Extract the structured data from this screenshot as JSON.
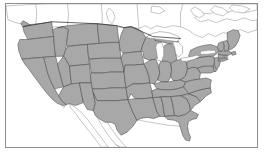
{
  "figure": {
    "kind": "map-figure",
    "frame": {
      "visible": true,
      "border_color": "#8c8c8c"
    },
    "background_color": "#ffffff"
  },
  "map": {
    "name": "united-states-map",
    "projection_hint": "albers-usa-like",
    "land_fill": "#a8a8a8",
    "state_border_color": "#4a4a4a",
    "neighbor_fill": "#ffffff",
    "neighbor_border_color": "#8a8a8a",
    "water_fill": "#ffffff",
    "labels_visible": false,
    "legend_visible": false,
    "features": {
      "states_filled": true,
      "great_lakes_unfilled": true,
      "canada_outline": true,
      "mexico_outline": true,
      "baja_california_outline": true
    },
    "regions": [
      {
        "id": "WA",
        "name": "Washington",
        "filled": true
      },
      {
        "id": "OR",
        "name": "Oregon",
        "filled": true
      },
      {
        "id": "CA",
        "name": "California",
        "filled": true
      },
      {
        "id": "NV",
        "name": "Nevada",
        "filled": true
      },
      {
        "id": "ID",
        "name": "Idaho",
        "filled": true
      },
      {
        "id": "MT",
        "name": "Montana",
        "filled": true
      },
      {
        "id": "WY",
        "name": "Wyoming",
        "filled": true
      },
      {
        "id": "UT",
        "name": "Utah",
        "filled": true
      },
      {
        "id": "AZ",
        "name": "Arizona",
        "filled": true
      },
      {
        "id": "CO",
        "name": "Colorado",
        "filled": true
      },
      {
        "id": "NM",
        "name": "New Mexico",
        "filled": true
      },
      {
        "id": "ND",
        "name": "North Dakota",
        "filled": true
      },
      {
        "id": "SD",
        "name": "South Dakota",
        "filled": true
      },
      {
        "id": "NE",
        "name": "Nebraska",
        "filled": true
      },
      {
        "id": "KS",
        "name": "Kansas",
        "filled": true
      },
      {
        "id": "OK",
        "name": "Oklahoma",
        "filled": true
      },
      {
        "id": "TX",
        "name": "Texas",
        "filled": true
      },
      {
        "id": "MN",
        "name": "Minnesota",
        "filled": true
      },
      {
        "id": "IA",
        "name": "Iowa",
        "filled": true
      },
      {
        "id": "MO",
        "name": "Missouri",
        "filled": true
      },
      {
        "id": "AR",
        "name": "Arkansas",
        "filled": true
      },
      {
        "id": "LA",
        "name": "Louisiana",
        "filled": true
      },
      {
        "id": "WI",
        "name": "Wisconsin",
        "filled": true
      },
      {
        "id": "IL",
        "name": "Illinois",
        "filled": true
      },
      {
        "id": "MS",
        "name": "Mississippi",
        "filled": true
      },
      {
        "id": "MI",
        "name": "Michigan",
        "filled": true
      },
      {
        "id": "IN",
        "name": "Indiana",
        "filled": true
      },
      {
        "id": "OH",
        "name": "Ohio",
        "filled": true
      },
      {
        "id": "KY",
        "name": "Kentucky",
        "filled": true
      },
      {
        "id": "TN",
        "name": "Tennessee",
        "filled": true
      },
      {
        "id": "AL",
        "name": "Alabama",
        "filled": true
      },
      {
        "id": "GA",
        "name": "Georgia",
        "filled": true
      },
      {
        "id": "FL",
        "name": "Florida",
        "filled": true
      },
      {
        "id": "SC",
        "name": "South Carolina",
        "filled": true
      },
      {
        "id": "NC",
        "name": "North Carolina",
        "filled": true
      },
      {
        "id": "VA",
        "name": "Virginia",
        "filled": true
      },
      {
        "id": "WV",
        "name": "West Virginia",
        "filled": true
      },
      {
        "id": "MD",
        "name": "Maryland",
        "filled": true
      },
      {
        "id": "DE",
        "name": "Delaware",
        "filled": true
      },
      {
        "id": "NJ",
        "name": "New Jersey",
        "filled": true
      },
      {
        "id": "PA",
        "name": "Pennsylvania",
        "filled": true
      },
      {
        "id": "NY",
        "name": "New York",
        "filled": true
      },
      {
        "id": "CT",
        "name": "Connecticut",
        "filled": true
      },
      {
        "id": "RI",
        "name": "Rhode Island",
        "filled": true
      },
      {
        "id": "MA",
        "name": "Massachusetts",
        "filled": true
      },
      {
        "id": "VT",
        "name": "Vermont",
        "filled": true
      },
      {
        "id": "NH",
        "name": "New Hampshire",
        "filled": true
      },
      {
        "id": "ME",
        "name": "Maine",
        "filled": true
      }
    ],
    "water_bodies": [
      {
        "id": "lake-superior",
        "name": "Lake Superior"
      },
      {
        "id": "lake-michigan",
        "name": "Lake Michigan"
      },
      {
        "id": "lake-huron",
        "name": "Lake Huron"
      },
      {
        "id": "lake-erie",
        "name": "Lake Erie"
      },
      {
        "id": "lake-ontario",
        "name": "Lake Ontario"
      }
    ],
    "neighbors": [
      {
        "id": "canada",
        "name": "Canada",
        "filled": false
      },
      {
        "id": "mexico",
        "name": "Mexico",
        "filled": false
      }
    ]
  }
}
